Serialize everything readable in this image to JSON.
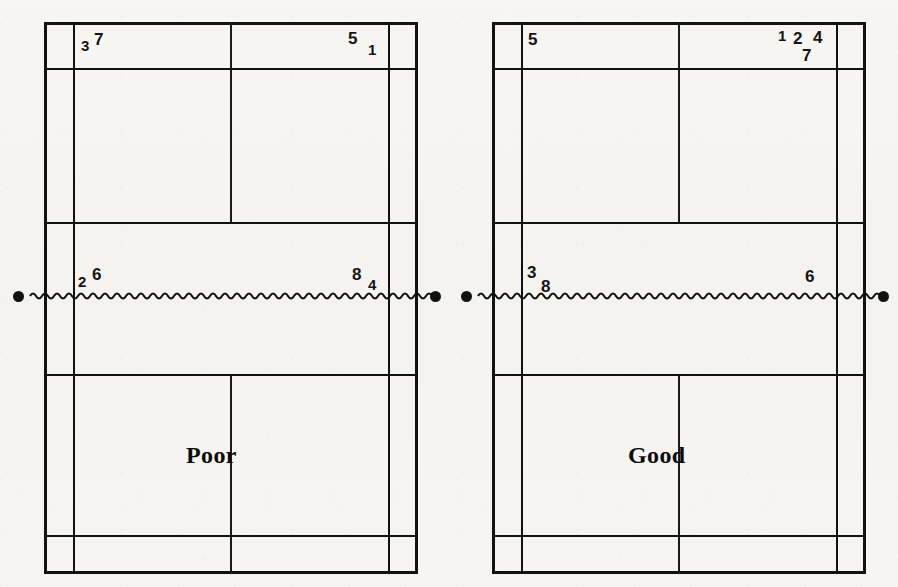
{
  "figure": {
    "type": "badminton-court-diagram",
    "background_color": "#f6f5f2",
    "line_color": "#111111"
  },
  "courts": [
    {
      "id": "left",
      "label": "Poor",
      "net": {
        "type": "wavy-line",
        "post_left": "net-post-dot",
        "post_right": "net-post-dot"
      },
      "marks": [
        {
          "id": "L-3",
          "value": "3"
        },
        {
          "id": "L-7",
          "value": "7"
        },
        {
          "id": "L-5",
          "value": "5"
        },
        {
          "id": "L-1",
          "value": "1"
        },
        {
          "id": "L-2",
          "value": "2"
        },
        {
          "id": "L-6",
          "value": "6"
        },
        {
          "id": "L-8",
          "value": "8"
        },
        {
          "id": "L-4",
          "value": "4"
        }
      ]
    },
    {
      "id": "right",
      "label": "Good",
      "net": {
        "type": "wavy-line",
        "post_left": "net-post-dot",
        "post_right": "net-post-dot"
      },
      "marks": [
        {
          "id": "R-5",
          "value": "5"
        },
        {
          "id": "R-1",
          "value": "1"
        },
        {
          "id": "R-2",
          "value": "2"
        },
        {
          "id": "R-4",
          "value": "4"
        },
        {
          "id": "R-7",
          "value": "7"
        },
        {
          "id": "R-3",
          "value": "3"
        },
        {
          "id": "R-8",
          "value": "8"
        },
        {
          "id": "R-6",
          "value": "6"
        }
      ]
    }
  ]
}
